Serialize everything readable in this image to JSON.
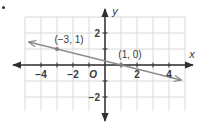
{
  "bullet_marker": "•",
  "chart_data": {
    "type": "line",
    "title": "",
    "xlabel": "x",
    "ylabel": "y",
    "xlim": [
      -5,
      5
    ],
    "ylim": [
      -3,
      3
    ],
    "grid": true,
    "x_tick_labels": [
      "-4",
      "-2",
      "2",
      "4"
    ],
    "x_ticks": [
      -4,
      -2,
      2,
      4
    ],
    "y_tick_labels": [
      "2",
      "-2"
    ],
    "y_ticks": [
      2,
      -2
    ],
    "origin_label": "O",
    "series": [
      {
        "name": "line",
        "points": [
          {
            "x": -3,
            "y": 1
          },
          {
            "x": 1,
            "y": 0
          }
        ],
        "slope": -0.25,
        "intercept": 0.25,
        "extends_both_directions": true,
        "color": "#8c8c8c"
      }
    ],
    "annotations": [
      {
        "text": "(−3, 1)",
        "x": -3,
        "y": 1
      },
      {
        "text": "(1, 0)",
        "x": 1,
        "y": 0
      }
    ]
  },
  "colors": {
    "axis": "#2f2f2f",
    "grid": "#d9d9d9",
    "line": "#8c8c8c",
    "point": "#7a7a7a",
    "text": "#3a3a3a"
  }
}
